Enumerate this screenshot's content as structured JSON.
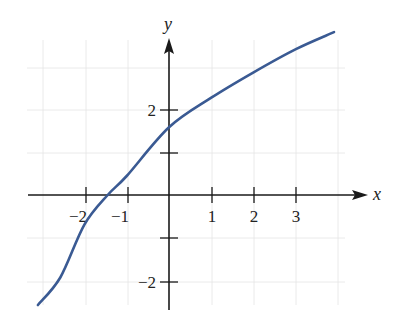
{
  "chart_data": {
    "type": "line",
    "title": "",
    "xlabel": "x",
    "ylabel": "y",
    "xlim": [
      -3.4,
      4.3
    ],
    "ylim": [
      -2.9,
      3.7
    ],
    "grid": true,
    "x_ticks": [
      -2,
      -1,
      1,
      2,
      3
    ],
    "x_tick_labels": [
      "−2",
      "−1",
      "1",
      "2",
      "3"
    ],
    "y_ticks": [
      -2,
      -1,
      1,
      2
    ],
    "y_tick_labels": [
      "−2",
      "",
      "",
      "2"
    ],
    "series": [
      {
        "name": "curve",
        "color": "#3a5a93",
        "x": [
          -3.1,
          -2.57,
          -2.0,
          -1.45,
          -1.0,
          0.0,
          1.0,
          2.0,
          3.0,
          3.9
        ],
        "y": [
          -2.6,
          -1.95,
          -0.7,
          0.0,
          0.45,
          1.6,
          2.3,
          2.9,
          3.45,
          3.85
        ]
      }
    ]
  },
  "labels": {
    "x_axis": "x",
    "y_axis": "y",
    "x_tick_m2": "−2",
    "x_tick_m1": "−1",
    "x_tick_1": "1",
    "x_tick_2": "2",
    "x_tick_3": "3",
    "y_tick_2": "2",
    "y_tick_m2": "−2"
  },
  "colors": {
    "curve": "#3a5a93",
    "axis": "#1a1a1a",
    "grid": "#e4e4e4"
  }
}
